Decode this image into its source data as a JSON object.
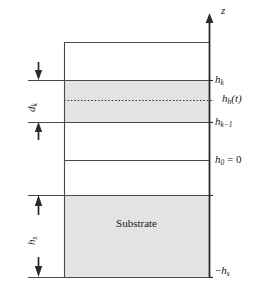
{
  "figure": {
    "background_color": "#ffffff",
    "line_color": "#2b2b2b",
    "shade_color": "#e3e3e3",
    "text_color": "#1a1a1a"
  },
  "axis": {
    "name": "z-axis",
    "label": "z",
    "orientation": "vertical",
    "arrow": "up",
    "x_px": 209,
    "top_px": 15,
    "bottom_px": 277
  },
  "labels": {
    "z": "z",
    "h_k": {
      "base": "h",
      "sub": "k"
    },
    "h_h_t": {
      "base": "h",
      "sub": "h",
      "arg": "(t)"
    },
    "h_k_minus_1": {
      "base": "h",
      "sub": "k−1"
    },
    "h_0_equals_0": {
      "base": "h",
      "sub": "0",
      "rest": " = 0"
    },
    "minus_h_s": {
      "prefix": "−",
      "base": "h",
      "sub": "s"
    },
    "d_k": {
      "base": "d",
      "sub": "k"
    },
    "h_s": {
      "base": "h",
      "sub": "s"
    },
    "substrate": "Substrate"
  },
  "levels": [
    {
      "name": "stack-top",
      "label": "",
      "y_px": 42,
      "shaded_above": false
    },
    {
      "name": "h_k",
      "label": "h_k",
      "y_px": 80
    },
    {
      "name": "h_h_t",
      "label": "h_h(t)",
      "y_px": 100,
      "style": "dashed"
    },
    {
      "name": "h_k_minus_1",
      "label": "h_{k-1}",
      "y_px": 122
    },
    {
      "name": "interlayer",
      "label": "",
      "y_px": 160
    },
    {
      "name": "h_0",
      "label": "h_0 = 0",
      "y_px": 195
    },
    {
      "name": "minus_h_s",
      "label": "-h_s",
      "y_px": 277
    }
  ],
  "regions": [
    {
      "name": "layer-k",
      "top_px": 80,
      "bottom_px": 122,
      "shaded": true
    },
    {
      "name": "substrate",
      "top_px": 195,
      "bottom_px": 277,
      "shaded": true,
      "label": "Substrate"
    }
  ],
  "dimensions": [
    {
      "name": "d_k",
      "label": "d_k",
      "from_y_px": 80,
      "to_y_px": 122,
      "arrow_x_px": 38
    },
    {
      "name": "h_s",
      "label": "h_s",
      "from_y_px": 195,
      "to_y_px": 277,
      "arrow_x_px": 38
    }
  ],
  "box": {
    "left_px": 64,
    "right_px": 209,
    "top_px": 42,
    "bottom_px": 277
  }
}
